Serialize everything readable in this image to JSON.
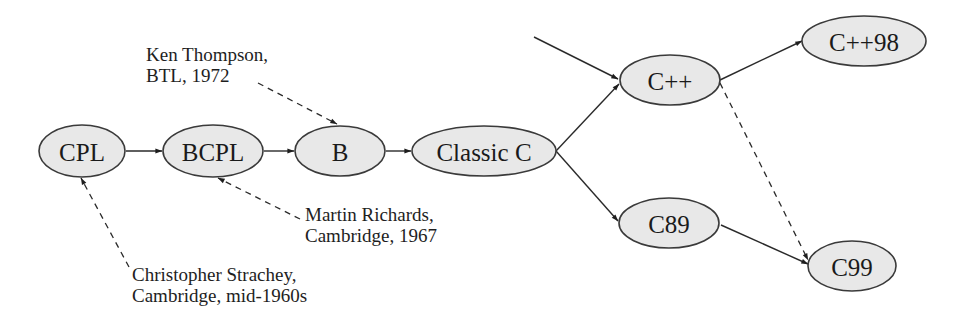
{
  "diagram": {
    "title": "",
    "type": "language-genealogy",
    "nodes": [
      {
        "id": "cpl",
        "label": "CPL",
        "cx": 82,
        "cy": 151,
        "rx": 43,
        "ry": 26
      },
      {
        "id": "bcpl",
        "label": "BCPL",
        "cx": 213,
        "cy": 151,
        "rx": 50,
        "ry": 26
      },
      {
        "id": "b",
        "label": "B",
        "cx": 340,
        "cy": 151,
        "rx": 45,
        "ry": 25
      },
      {
        "id": "classic-c",
        "label": "Classic C",
        "cx": 484,
        "cy": 151,
        "rx": 72,
        "ry": 25
      },
      {
        "id": "cpp",
        "label": "C++",
        "cx": 670,
        "cy": 80,
        "rx": 50,
        "ry": 25
      },
      {
        "id": "cpp98",
        "label": "C++98",
        "cx": 864,
        "cy": 41,
        "rx": 62,
        "ry": 25
      },
      {
        "id": "c89",
        "label": "C89",
        "cx": 669,
        "cy": 223,
        "rx": 50,
        "ry": 25
      },
      {
        "id": "c99",
        "label": "C99",
        "cx": 852,
        "cy": 266,
        "rx": 44,
        "ry": 25
      }
    ],
    "edges": [
      {
        "from": "cpl",
        "to": "bcpl",
        "style": "solid"
      },
      {
        "from": "bcpl",
        "to": "b",
        "style": "solid"
      },
      {
        "from": "b",
        "to": "classic-c",
        "style": "solid"
      },
      {
        "from": "classic-c",
        "to": "cpp",
        "style": "solid"
      },
      {
        "from": "classic-c",
        "to": "c89",
        "style": "solid"
      },
      {
        "from": "external",
        "to": "cpp",
        "style": "solid"
      },
      {
        "from": "cpp",
        "to": "cpp98",
        "style": "solid"
      },
      {
        "from": "c89",
        "to": "c99",
        "style": "solid"
      },
      {
        "from": "cpp",
        "to": "c99",
        "style": "dashed"
      }
    ],
    "annotations": [
      {
        "id": "ken-thompson",
        "lines": [
          "Ken Thompson,",
          "BTL, 1972"
        ],
        "points_to": "b"
      },
      {
        "id": "martin-richards",
        "lines": [
          "Martin Richards,",
          "Cambridge, 1967"
        ],
        "points_to": "bcpl"
      },
      {
        "id": "christopher-strachey",
        "lines": [
          "Christopher Strachey,",
          "Cambridge, mid-1960s"
        ],
        "points_to": "cpl"
      }
    ],
    "colors": {
      "node_fill": "#e8e8e8",
      "node_stroke": "#3a3a3a",
      "edge": "#2a2a2a",
      "text": "#1a1a1a",
      "background": "#ffffff"
    }
  }
}
